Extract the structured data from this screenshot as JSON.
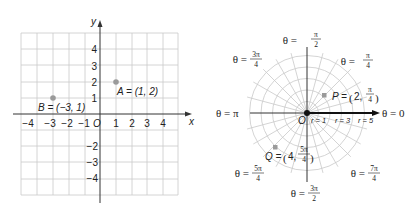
{
  "chart_data": [
    {
      "type": "scatter",
      "title": "Rectangular coordinates",
      "xlabel": "x",
      "ylabel": "y",
      "xlim": [
        -5,
        5
      ],
      "ylim": [
        -5,
        5
      ],
      "grid": true,
      "x_ticks": [
        "-4",
        "-3",
        "-2",
        "-1",
        "1",
        "2",
        "3",
        "4"
      ],
      "y_ticks": [
        "4",
        "3",
        "2",
        "1",
        "-2",
        "-3",
        "-4"
      ],
      "origin_label": "O",
      "points": [
        {
          "name": "A",
          "x": 1,
          "y": 2,
          "label": "A = (1, 2)"
        },
        {
          "name": "B",
          "x": -3,
          "y": 1,
          "label": "B = (−3, 1)"
        }
      ]
    },
    {
      "type": "scatter",
      "title": "Polar coordinates",
      "coordinate_system": "polar",
      "r_max": 5,
      "radial_step": "π/12",
      "origin_label": "O",
      "r_labels": [
        "r = 1",
        "r = 3",
        "r = 5"
      ],
      "angle_labels": [
        {
          "theta": "0",
          "text": "θ = 0"
        },
        {
          "theta": "π/4",
          "text": "θ = π/4"
        },
        {
          "theta": "π/2",
          "text": "θ = π/2"
        },
        {
          "theta": "3π/4",
          "text": "θ = 3π/4"
        },
        {
          "theta": "π",
          "text": "θ = π"
        },
        {
          "theta": "5π/4",
          "text": "θ = 5π/4"
        },
        {
          "theta": "3π/2",
          "text": "θ = 3π/2"
        },
        {
          "theta": "7π/4",
          "text": "θ = 7π/4"
        }
      ],
      "points": [
        {
          "name": "P",
          "r": 2,
          "theta": "π/4",
          "label": "P = (2, π/4)"
        },
        {
          "name": "Q",
          "r": 4,
          "theta": "5π/4",
          "label": "Q = (4, 5π/4)"
        }
      ]
    }
  ],
  "rect": {
    "x_axis": "x",
    "y_axis": "y",
    "origin": "O",
    "xt": [
      "−4",
      "−3",
      "−2",
      "−1",
      "1",
      "2",
      "3",
      "4"
    ],
    "yt_pos": [
      "4",
      "3",
      "2",
      "1"
    ],
    "yt_neg": [
      "−2",
      "−3",
      "−4"
    ],
    "A": "A = (1, 2)",
    "B": "B = (−3, 1)"
  },
  "polar": {
    "origin": "O",
    "r1": "r = 1",
    "r3": "r = 3",
    "r5": "r = 5",
    "t0": "θ = 0",
    "tpi": "θ = π",
    "theta_eq": "θ =",
    "pi": "π",
    "three_pi": "3π",
    "five_pi": "5π",
    "seven_pi": "7π",
    "two": "2",
    "four": "4",
    "P_name": "P =",
    "P_r": "2,",
    "Q_name": "Q =",
    "Q_r": "4,"
  },
  "colors": {
    "grid": "#c9c9c9",
    "axis": "#333333",
    "point": "#9a9a9a"
  }
}
